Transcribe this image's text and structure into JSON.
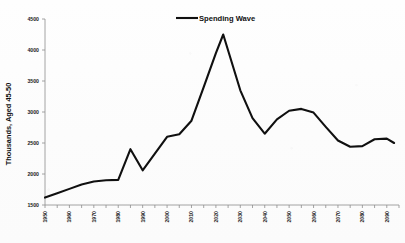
{
  "chart_data": {
    "type": "line",
    "title": "",
    "xlabel": "",
    "ylabel": "Thousands, Aged 45-50",
    "xlim": [
      1950,
      2095
    ],
    "ylim": [
      1500,
      4500
    ],
    "grid": false,
    "legend_position": "top-center",
    "y_ticks": [
      1500,
      2000,
      2500,
      3000,
      3500,
      4000,
      4500
    ],
    "y_tick_labels": [
      "1500",
      "2000",
      "2500",
      "3000",
      "3500",
      "4000",
      "4500"
    ],
    "x_ticks": [
      1950,
      1960,
      1970,
      1980,
      1990,
      2000,
      2010,
      2020,
      2030,
      2040,
      2050,
      2060,
      2070,
      2080,
      2090
    ],
    "x_tick_labels": [
      "1950",
      "1960",
      "1970",
      "1980",
      "1990",
      "2000",
      "2010",
      "2020",
      "2030",
      "2040",
      "2050",
      "2060",
      "2070",
      "2080",
      "2090"
    ],
    "x_minor_tick_step": 5,
    "series": [
      {
        "name": "Spending Wave",
        "color": "#101010",
        "x": [
          1950,
          1955,
          1960,
          1965,
          1970,
          1975,
          1980,
          1985,
          1990,
          1995,
          2000,
          2005,
          2010,
          2015,
          2020,
          2023,
          2030,
          2035,
          2040,
          2045,
          2050,
          2055,
          2060,
          2065,
          2070,
          2075,
          2080,
          2085,
          2090,
          2093
        ],
        "values": [
          1620,
          1690,
          1760,
          1830,
          1880,
          1900,
          1905,
          2400,
          2060,
          2330,
          2600,
          2640,
          2860,
          3400,
          3950,
          4250,
          3350,
          2900,
          2650,
          2880,
          3020,
          3050,
          2990,
          2760,
          2540,
          2440,
          2450,
          2560,
          2570,
          2500
        ]
      }
    ]
  },
  "legend": {
    "entries": [
      {
        "label": "Spending Wave",
        "color": "#101010"
      }
    ]
  },
  "axis_titles": {
    "y": "Thousands, Aged 45-50"
  }
}
